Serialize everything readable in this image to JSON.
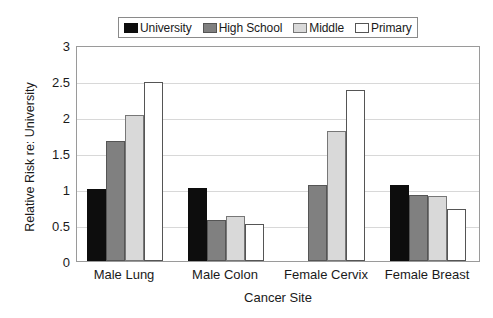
{
  "chart_data": {
    "type": "bar",
    "title": "",
    "xlabel": "Cancer Site",
    "ylabel": "Relative Risk re: University",
    "categories": [
      "Male Lung",
      "Male Colon",
      "Female Cervix",
      "Female Breast"
    ],
    "series": [
      {
        "name": "University",
        "color": "#0d0d0d",
        "values": [
          1.0,
          1.02,
          0.0,
          1.05
        ]
      },
      {
        "name": "High School",
        "color": "#808080",
        "values": [
          1.67,
          0.57,
          1.05,
          0.92
        ]
      },
      {
        "name": "Middle",
        "color": "#d9d9d9",
        "values": [
          2.03,
          0.62,
          1.81,
          0.9
        ]
      },
      {
        "name": "Primary",
        "color": "#ffffff",
        "values": [
          2.49,
          0.51,
          2.37,
          0.72
        ]
      }
    ],
    "ylim": [
      0,
      3
    ],
    "yticks": [
      "0",
      "0.5",
      "1",
      "1.5",
      "2",
      "2.5",
      "3"
    ],
    "ytick_values": [
      0,
      0.5,
      1,
      1.5,
      2,
      2.5,
      3
    ],
    "grid": true,
    "legend_position": "top-center"
  }
}
